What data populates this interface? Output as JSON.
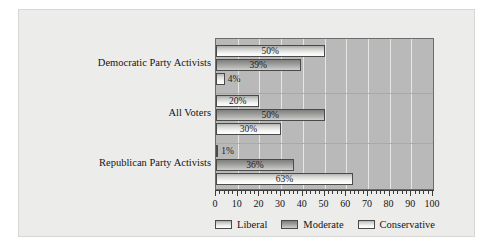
{
  "chart_data": {
    "type": "bar",
    "orientation": "horizontal",
    "title": "",
    "subtitle": "",
    "xlabel": "",
    "ylabel": "",
    "xlim": [
      0,
      100
    ],
    "xticks": [
      0,
      10,
      20,
      30,
      40,
      50,
      60,
      70,
      80,
      90,
      100
    ],
    "xtick_labels": [
      "0",
      "10",
      "20",
      "30",
      "40",
      "50",
      "60",
      "70",
      "80",
      "90",
      "100"
    ],
    "grid": true,
    "grid_axis": "x",
    "legend_position": "bottom",
    "categories": [
      "Democratic Party Activists",
      "All Voters",
      "Republican Party Activists"
    ],
    "series": [
      {
        "name": "Liberal",
        "values": [
          50,
          20,
          1
        ],
        "labels": [
          "50%",
          "20%",
          "1%"
        ]
      },
      {
        "name": "Moderate",
        "values": [
          39,
          50,
          36
        ],
        "labels": [
          "39%",
          "50%",
          "36%"
        ]
      },
      {
        "name": "Conservative",
        "values": [
          4,
          30,
          63
        ],
        "labels": [
          "4%",
          "30%",
          "63%"
        ]
      }
    ],
    "bar_order_top_to_bottom": [
      "Liberal",
      "Moderate",
      "Conservative"
    ],
    "value_label_suffix": "%"
  },
  "legend": {
    "items": [
      {
        "label": "Liberal",
        "swatch": "liberal-swatch"
      },
      {
        "label": "Moderate",
        "swatch": "moderate-swatch"
      },
      {
        "label": "Conservative",
        "swatch": "conservative-swatch"
      }
    ]
  },
  "colors": {
    "plot_background": "#b9b9b9",
    "card_background": "#ececeb",
    "gridline": "#e6e6e4",
    "axis": "#3b3b3b",
    "bar_outline": "#4a4a4a",
    "text": "#141414",
    "liberal": "#e8e8e6",
    "moderate": "#9a9a99",
    "conservative": "#f2f2f0"
  }
}
